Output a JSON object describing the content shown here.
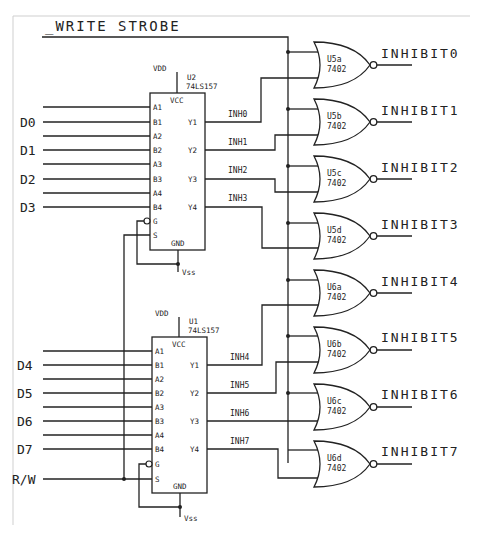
{
  "title": "_WRITE STROBE",
  "chips": {
    "u2": {
      "ref": "U2",
      "part": "74LS157",
      "vcc": "VCC",
      "gnd": "GND",
      "vdd": "VDD",
      "vss": "Vss"
    },
    "u1": {
      "ref": "U1",
      "part": "74LS157",
      "vcc": "VCC",
      "gnd": "GND",
      "vdd": "VDD",
      "vss": "Vss"
    }
  },
  "mux_pins": {
    "inputs": [
      "A1",
      "B1",
      "A2",
      "B2",
      "A3",
      "B3",
      "A4",
      "B4",
      "G",
      "S"
    ],
    "outputs": [
      "Y1",
      "Y2",
      "Y3",
      "Y4"
    ]
  },
  "data_inputs": [
    "D0",
    "D1",
    "D2",
    "D3",
    "D4",
    "D5",
    "D6",
    "D7"
  ],
  "rw_label": "R/W",
  "inh_nets": [
    "INH0",
    "INH1",
    "INH2",
    "INH3",
    "INH4",
    "INH5",
    "INH6",
    "INH7"
  ],
  "gates": [
    {
      "ref": "U5a",
      "part": "7402",
      "out": "INHIBIT0"
    },
    {
      "ref": "U5b",
      "part": "7402",
      "out": "INHIBIT1"
    },
    {
      "ref": "U5c",
      "part": "7402",
      "out": "INHIBIT2"
    },
    {
      "ref": "U5d",
      "part": "7402",
      "out": "INHIBIT3"
    },
    {
      "ref": "U6a",
      "part": "7402",
      "out": "INHIBIT4"
    },
    {
      "ref": "U6b",
      "part": "7402",
      "out": "INHIBIT5"
    },
    {
      "ref": "U6c",
      "part": "7402",
      "out": "INHIBIT6"
    },
    {
      "ref": "U6d",
      "part": "7402",
      "out": "INHIBIT7"
    }
  ],
  "colors": {
    "line": "#222222",
    "frame": "#cccccc",
    "background": "#ffffff"
  }
}
